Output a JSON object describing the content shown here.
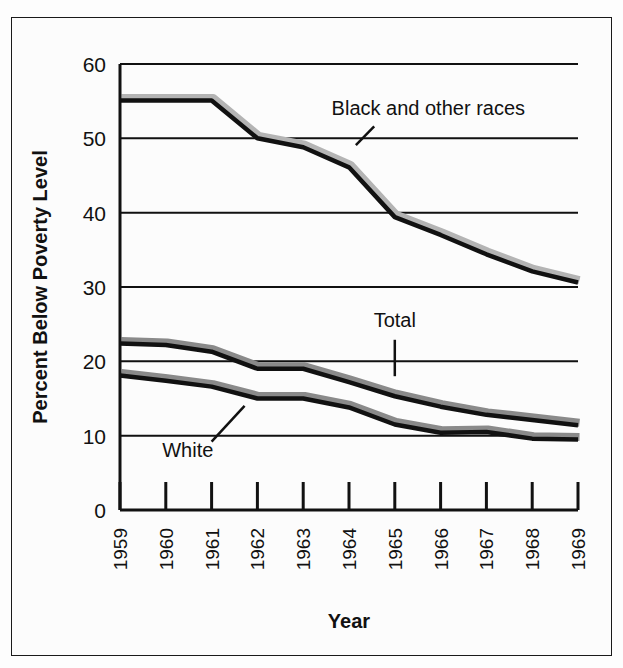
{
  "chart_data": {
    "type": "line",
    "title": "",
    "xlabel": "Year",
    "ylabel": "Percent Below Poverty Level",
    "categories": [
      1959,
      1960,
      1961,
      1962,
      1963,
      1964,
      1965,
      1966,
      1967,
      1968,
      1969
    ],
    "x": [
      "1959",
      "1960",
      "1961",
      "1962",
      "1963",
      "1964",
      "1965",
      "1966",
      "1967",
      "1968",
      "1969"
    ],
    "xlim": [
      1959,
      1969
    ],
    "ylim": [
      0,
      60
    ],
    "yticks": [
      0,
      10,
      20,
      30,
      40,
      50,
      60
    ],
    "ytick_labels": [
      "0",
      "10",
      "20",
      "30",
      "40",
      "50",
      "60"
    ],
    "grid": true,
    "grid_axis": "y",
    "legend": "none",
    "legend_position": "inline-annotations",
    "series": [
      {
        "name": "Black and other races",
        "values": [
          55.1,
          55.1,
          55.1,
          50.0,
          48.8,
          46.1,
          39.4,
          37.0,
          34.4,
          32.1,
          30.6
        ],
        "color": "#111111",
        "shadow_color": "#b4b4b4"
      },
      {
        "name": "Total",
        "values": [
          22.4,
          22.2,
          21.3,
          19.0,
          19.0,
          17.2,
          15.3,
          13.9,
          12.8,
          12.1,
          11.4
        ],
        "color": "#111111",
        "shadow_color": "#8a8a8a"
      },
      {
        "name": "White",
        "values": [
          18.1,
          17.4,
          16.6,
          15.0,
          15.0,
          13.8,
          11.5,
          10.4,
          10.5,
          9.6,
          9.5
        ],
        "color": "#111111",
        "shadow_color": "#8a8a8a"
      }
    ],
    "annotations": [
      {
        "label": "Black and other races",
        "label_x": 1963.62,
        "label_y": 53.2,
        "anchor": "start",
        "leader": {
          "type": "diagonal",
          "x1": 1964.55,
          "y1": 51.6,
          "x2": 1964.15,
          "y2": 49.1
        }
      },
      {
        "label": "Total",
        "label_x": 1965.0,
        "label_y": 24.6,
        "anchor": "middle",
        "leader": {
          "type": "vertical",
          "x1": 1965.0,
          "y1": 22.9,
          "x2": 1965.0,
          "y2": 18.0
        }
      },
      {
        "label": "White",
        "label_x": 1960.48,
        "label_y": 7.1,
        "anchor": "middle",
        "leader": {
          "type": "diagonal",
          "x1": 1961.0,
          "y1": 9.2,
          "x2": 1961.72,
          "y2": 14.0
        }
      }
    ]
  },
  "axis": {
    "x_title": "Year",
    "y_title": "Percent Below Poverty Level",
    "y_ticks": [
      "0",
      "10",
      "20",
      "30",
      "40",
      "50",
      "60"
    ],
    "x_ticks": [
      "1959",
      "1960",
      "1961",
      "1962",
      "1963",
      "1964",
      "1965",
      "1966",
      "1967",
      "1968",
      "1969"
    ]
  },
  "annotations": {
    "black_and_other": "Black and other races",
    "total": "Total",
    "white": "White"
  },
  "colors": {
    "line": "#111111",
    "shadow_light": "#b4b4b4",
    "shadow_dark": "#8a8a8a",
    "axis": "#111111",
    "background": "#fcfcfc",
    "border": "#1a1a1a"
  }
}
